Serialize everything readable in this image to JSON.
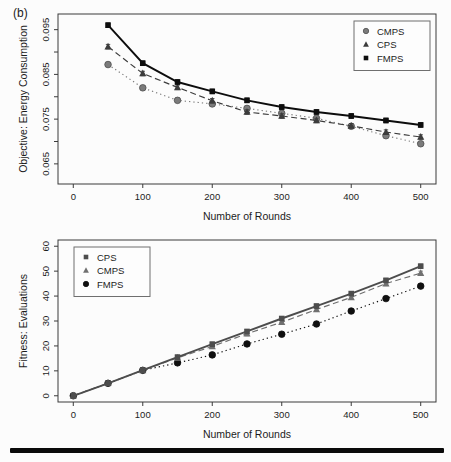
{
  "figure_label": "(b)",
  "chart_data": [
    {
      "type": "line",
      "title": "",
      "xlabel": "Number of Rounds",
      "ylabel": "Objective: Energy Consumption",
      "x": [
        50,
        100,
        150,
        200,
        250,
        300,
        350,
        400,
        450,
        500
      ],
      "series": [
        {
          "name": "CMPS",
          "marker": "circle",
          "line": "dotted",
          "color": "#7b7b7b",
          "edge": "#4f4f4f",
          "values": [
            0.0872,
            0.082,
            0.0792,
            0.0784,
            0.0774,
            0.0763,
            0.0752,
            0.0734,
            0.0713,
            0.0695
          ]
        },
        {
          "name": "CPS",
          "marker": "triangle",
          "line": "dashed",
          "color": "#3c3c3c",
          "edge": "#3c3c3c",
          "values": [
            0.0912,
            0.0852,
            0.0821,
            0.0791,
            0.0766,
            0.0757,
            0.0747,
            0.0735,
            0.0721,
            0.071
          ]
        },
        {
          "name": "FMPS",
          "marker": "square",
          "line": "solid",
          "color": "#0d0d0d",
          "edge": "#0d0d0d",
          "values": [
            0.096,
            0.0875,
            0.0833,
            0.0812,
            0.0792,
            0.0777,
            0.0766,
            0.0757,
            0.0747,
            0.0737
          ]
        }
      ],
      "xlim": [
        -22,
        522
      ],
      "ylim": [
        0.0605,
        0.0985
      ],
      "xticks": [
        0,
        100,
        200,
        300,
        400,
        500
      ],
      "yticks": [
        0.065,
        0.075,
        0.085,
        0.095
      ],
      "minor_yticks": [
        0.07,
        0.08,
        0.09
      ],
      "ytick_decimals": 3,
      "error_bar": 0.0005,
      "grid": false,
      "legend": {
        "position": "top-right",
        "items": [
          "CMPS",
          "CPS",
          "FMPS"
        ]
      }
    },
    {
      "type": "line",
      "title": "",
      "xlabel": "Number of Rounds",
      "ylabel": "Fitness: Evaluations",
      "x": [
        0,
        50,
        100,
        150,
        200,
        250,
        300,
        350,
        400,
        450,
        500
      ],
      "series": [
        {
          "name": "FMPS",
          "marker": "circle",
          "line": "dotted",
          "color": "#0f0f0f",
          "edge": "#0f0f0f",
          "values": [
            0,
            5,
            10.2,
            13.2,
            16.4,
            20.8,
            24.7,
            28.8,
            34,
            39,
            44
          ]
        },
        {
          "name": "CMPS",
          "marker": "triangle",
          "line": "dashed",
          "color": "#707070",
          "edge": "#565656",
          "values": [
            0,
            5,
            10.2,
            15.2,
            19.8,
            24.9,
            29.5,
            34.6,
            39.5,
            45,
            49.2
          ]
        },
        {
          "name": "CPS",
          "marker": "square",
          "line": "solid",
          "color": "#4d4d4d",
          "edge": "#4d4d4d",
          "values": [
            0,
            5,
            10.3,
            15.5,
            20.7,
            25.8,
            31,
            36,
            41,
            46.3,
            52
          ]
        }
      ],
      "xlim": [
        -22,
        522
      ],
      "ylim": [
        -2.5,
        62.5
      ],
      "xticks": [
        0,
        100,
        200,
        300,
        400,
        500
      ],
      "yticks": [
        0,
        10,
        20,
        30,
        40,
        50,
        60
      ],
      "minor_yticks": [],
      "ytick_decimals": 0,
      "error_bar": 0.8,
      "grid": false,
      "legend": {
        "position": "top-left",
        "items": [
          "CPS",
          "CMPS",
          "FMPS"
        ]
      }
    }
  ]
}
